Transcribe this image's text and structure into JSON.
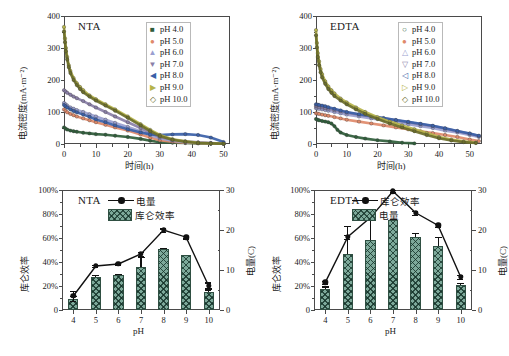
{
  "figure": {
    "panel_count": 4,
    "ph_legend_labels": [
      "pH 4.0",
      "pH 5.0",
      "pH 6.0",
      "pH 7.0",
      "pH 8.0",
      "pH 9.0",
      "pH 10.0"
    ],
    "ph_series_colors": [
      "#2f5d3a",
      "#e08a6a",
      "#9a9fd0",
      "#8a7fa8",
      "#3a5fa8",
      "#b5b34a",
      "#6b6e2a"
    ],
    "marker_glyphs": [
      "■",
      "●",
      "▲",
      "▼",
      "◀",
      "▶",
      "◇"
    ],
    "accent_line_color": "#111111",
    "bar_fill_color": "#7da99a",
    "bar_edge_color": "#2f4f42"
  },
  "chart_data": [
    {
      "id": "panel-a-nta-current-density",
      "type": "line",
      "title": "NTA",
      "xlabel": "时间(h)",
      "ylabel": "电流密度(mA·m⁻²)",
      "xlim": [
        0,
        52
      ],
      "ylim": [
        0,
        400
      ],
      "xticks": [
        0,
        10,
        20,
        30,
        40,
        50
      ],
      "yticks": [
        0,
        100,
        200,
        300,
        400
      ],
      "ytick_labels": [
        "0",
        "100",
        "200",
        "300",
        "400"
      ],
      "grid": false,
      "legend_position": "top-right",
      "legend_entries": [
        "pH 4.0",
        "pH 5.0",
        "pH 6.0",
        "pH 7.0",
        "pH 8.0",
        "pH 9.0",
        "pH 10.0"
      ],
      "series": [
        {
          "name": "pH 4.0",
          "color": "#2f5d3a",
          "marker": "■",
          "x": [
            0,
            0.5,
            1,
            2,
            3,
            4,
            6,
            8,
            10,
            13,
            16,
            20,
            24,
            27,
            30,
            34,
            38,
            42,
            46,
            50
          ],
          "y": [
            52,
            48,
            45,
            42,
            40,
            38,
            35,
            33,
            31,
            29,
            26,
            22,
            16,
            10,
            6,
            4,
            3,
            2,
            1,
            1
          ]
        },
        {
          "name": "pH 5.0",
          "color": "#e08a6a",
          "marker": "●",
          "x": [
            0,
            0.5,
            1,
            2,
            3,
            4,
            6,
            8,
            10,
            13,
            16,
            20,
            24,
            27,
            30,
            34,
            38,
            42,
            46,
            50
          ],
          "y": [
            108,
            103,
            99,
            94,
            90,
            86,
            80,
            74,
            68,
            60,
            52,
            42,
            30,
            20,
            12,
            7,
            4,
            3,
            2,
            1
          ]
        },
        {
          "name": "pH 6.0",
          "color": "#9a9fd0",
          "marker": "▲",
          "x": [
            0,
            0.5,
            1,
            2,
            3,
            4,
            6,
            8,
            10,
            13,
            16,
            20,
            24,
            27,
            30,
            34,
            38,
            42,
            46,
            50
          ],
          "y": [
            128,
            124,
            120,
            114,
            110,
            106,
            100,
            93,
            86,
            76,
            66,
            53,
            40,
            28,
            18,
            10,
            6,
            4,
            2,
            1
          ]
        },
        {
          "name": "pH 7.0",
          "color": "#8a7fa8",
          "marker": "▼",
          "x": [
            0,
            0.5,
            1,
            2,
            3,
            4,
            6,
            8,
            10,
            13,
            16,
            20,
            24,
            27,
            30,
            34,
            38,
            42,
            46,
            50
          ],
          "y": [
            168,
            164,
            160,
            154,
            148,
            143,
            134,
            124,
            114,
            100,
            86,
            68,
            50,
            34,
            22,
            13,
            8,
            5,
            3,
            1
          ]
        },
        {
          "name": "pH 8.0",
          "color": "#3a5fa8",
          "marker": "◀",
          "x": [
            0,
            0.5,
            1,
            2,
            3,
            4,
            6,
            8,
            10,
            13,
            16,
            20,
            24,
            27,
            30,
            34,
            38,
            42,
            46,
            50
          ],
          "y": [
            122,
            118,
            114,
            108,
            103,
            99,
            92,
            85,
            77,
            68,
            58,
            46,
            36,
            30,
            28,
            30,
            31,
            28,
            20,
            6
          ]
        },
        {
          "name": "pH 9.0",
          "color": "#b5b34a",
          "marker": "▶",
          "x": [
            0,
            0.3,
            0.6,
            1,
            1.5,
            2,
            3,
            4,
            5,
            6,
            8,
            10,
            13,
            16,
            20,
            24,
            27,
            30,
            34,
            38,
            42,
            46,
            50
          ],
          "y": [
            366,
            330,
            300,
            272,
            246,
            228,
            206,
            190,
            178,
            168,
            152,
            140,
            124,
            108,
            86,
            62,
            44,
            28,
            15,
            8,
            4,
            2,
            1
          ]
        },
        {
          "name": "pH 10.0",
          "color": "#6b6e2a",
          "marker": "◇",
          "x": [
            0,
            0.3,
            0.6,
            1,
            1.5,
            2,
            3,
            4,
            5,
            6,
            8,
            10,
            13,
            16,
            20,
            24,
            27,
            30,
            34,
            38,
            42,
            46,
            50
          ],
          "y": [
            352,
            318,
            290,
            264,
            240,
            222,
            200,
            184,
            172,
            162,
            148,
            136,
            120,
            104,
            82,
            58,
            40,
            25,
            13,
            7,
            3,
            2,
            1
          ]
        }
      ]
    },
    {
      "id": "panel-b-edta-current-density",
      "type": "line",
      "title": "EDTA",
      "xlabel": "时间(h)",
      "ylabel": "电流密度(mA·m⁻²)",
      "xlim": [
        0,
        54
      ],
      "ylim": [
        0,
        400
      ],
      "xticks": [
        0,
        10,
        20,
        30,
        40,
        50
      ],
      "yticks": [
        0,
        100,
        200,
        300,
        400
      ],
      "ytick_labels": [
        "0",
        "100",
        "200",
        "300",
        "400"
      ],
      "grid": false,
      "legend_position": "top-right",
      "legend_entries": [
        "pH 4.0",
        "pH 5.0",
        "pH 6.0",
        "pH 7.0",
        "pH 8.0",
        "pH 9.0",
        "pH 10.0"
      ],
      "series": [
        {
          "name": "pH 4.0",
          "color": "#2f5d3a",
          "marker": "○",
          "x": [
            0,
            0.5,
            1,
            2,
            3,
            4,
            5,
            6,
            7,
            8,
            10,
            13,
            16,
            20,
            24,
            28,
            32
          ],
          "y": [
            78,
            76,
            74,
            72,
            70,
            68,
            64,
            56,
            44,
            36,
            28,
            22,
            17,
            12,
            8,
            4,
            2
          ]
        },
        {
          "name": "pH 5.0",
          "color": "#e08a6a",
          "marker": "●",
          "x": [
            0,
            0.5,
            1,
            2,
            3,
            4,
            6,
            8,
            10,
            14,
            18,
            22,
            26,
            30,
            34,
            38,
            42,
            46,
            50,
            53
          ],
          "y": [
            96,
            95,
            94,
            92,
            90,
            88,
            84,
            80,
            76,
            70,
            64,
            58,
            52,
            46,
            40,
            34,
            28,
            22,
            14,
            9
          ]
        },
        {
          "name": "pH 6.0",
          "color": "#9a9fd0",
          "marker": "△",
          "x": [
            0,
            0.5,
            1,
            2,
            3,
            4,
            6,
            8,
            10,
            14,
            18,
            22,
            26,
            30,
            34,
            38,
            42,
            46,
            50,
            53
          ],
          "y": [
            112,
            111,
            110,
            108,
            106,
            104,
            100,
            96,
            92,
            86,
            80,
            74,
            68,
            62,
            56,
            50,
            42,
            36,
            28,
            22
          ]
        },
        {
          "name": "pH 7.0",
          "color": "#8a7fa8",
          "marker": "▽",
          "x": [
            0,
            0.5,
            1,
            2,
            3,
            4,
            6,
            8,
            10,
            14,
            18,
            22,
            26,
            30,
            34,
            38,
            42,
            46,
            50,
            53
          ],
          "y": [
            118,
            117,
            116,
            114,
            112,
            110,
            106,
            102,
            98,
            92,
            86,
            80,
            74,
            68,
            62,
            56,
            48,
            40,
            32,
            25
          ]
        },
        {
          "name": "pH 8.0",
          "color": "#3a5fa8",
          "marker": "◁",
          "x": [
            0,
            0.5,
            1,
            2,
            3,
            4,
            6,
            8,
            10,
            14,
            18,
            22,
            26,
            30,
            34,
            38,
            42,
            46,
            50,
            53
          ],
          "y": [
            124,
            123,
            122,
            120,
            118,
            115,
            110,
            105,
            100,
            93,
            87,
            81,
            75,
            69,
            63,
            57,
            49,
            41,
            33,
            26
          ]
        },
        {
          "name": "pH 9.0",
          "color": "#b5b34a",
          "marker": "▷",
          "x": [
            0,
            0.3,
            0.6,
            1,
            1.5,
            2,
            3,
            4,
            5,
            6,
            8,
            10,
            13,
            16,
            20,
            24,
            28,
            32,
            36,
            40,
            44,
            48,
            52
          ],
          "y": [
            356,
            316,
            284,
            258,
            234,
            218,
            196,
            180,
            168,
            158,
            142,
            130,
            114,
            100,
            84,
            70,
            58,
            46,
            34,
            22,
            14,
            8,
            4
          ]
        },
        {
          "name": "pH 10.0",
          "color": "#6b6e2a",
          "marker": "◇",
          "x": [
            0,
            0.3,
            0.6,
            1,
            1.5,
            2,
            3,
            4,
            5,
            6,
            8,
            10,
            13,
            16,
            20,
            24,
            28,
            32,
            36,
            40,
            44,
            48,
            52
          ],
          "y": [
            340,
            302,
            272,
            246,
            224,
            208,
            188,
            172,
            160,
            150,
            136,
            124,
            108,
            94,
            78,
            64,
            52,
            40,
            28,
            18,
            11,
            6,
            3
          ]
        }
      ]
    },
    {
      "id": "panel-c-nta-coulombic-charge",
      "type": "bar",
      "title": "NTA",
      "xlabel": "pH",
      "ylabel": "库仑效率",
      "y2label": "电量(C)",
      "categories": [
        "4",
        "5",
        "6",
        "7",
        "8",
        "9",
        "10"
      ],
      "ylim": [
        0,
        100
      ],
      "yticks": [
        0,
        20,
        40,
        60,
        80,
        100
      ],
      "ytick_labels": [
        "0",
        "20%",
        "40%",
        "60%",
        "80%",
        "100%"
      ],
      "y2lim": [
        0,
        30
      ],
      "y2ticks": [
        0,
        10,
        20,
        30
      ],
      "y2tick_labels": [
        "0",
        "10",
        "20",
        "30"
      ],
      "grid": false,
      "legend_position": "top-center",
      "bar_series": {
        "name": "库仑效率",
        "axis": "left",
        "unit": "%",
        "values": [
          9,
          27.5,
          29,
          36,
          50.5,
          46,
          15
        ],
        "errors": [
          3,
          1.5,
          0.8,
          8,
          1.5,
          0,
          3
        ]
      },
      "line_series": {
        "name": "电量",
        "axis": "right",
        "unit": "C",
        "values": [
          3.5,
          11,
          11.5,
          14,
          20,
          18.2,
          6
        ],
        "errors": [
          1.2,
          0.3,
          0.2,
          0.5,
          0.4,
          0.3,
          0.9
        ]
      }
    },
    {
      "id": "panel-d-edta-coulombic-charge",
      "type": "bar",
      "title": "EDTA",
      "xlabel": "pH",
      "ylabel": "库仑效率",
      "y2label": "电量(C)",
      "categories": [
        "4",
        "5",
        "6",
        "7",
        "8",
        "9",
        "10"
      ],
      "ylim": [
        0,
        100
      ],
      "yticks": [
        0,
        20,
        40,
        60,
        80,
        100
      ],
      "ytick_labels": [
        "0",
        "20%",
        "40%",
        "60%",
        "80%",
        "100%"
      ],
      "y2lim": [
        0,
        30
      ],
      "y2ticks": [
        0,
        10,
        20,
        30
      ],
      "y2tick_labels": [
        "0",
        "10",
        "20",
        "30"
      ],
      "grid": false,
      "legend_position": "top-right",
      "bar_series": {
        "name": "电量",
        "axis": "right",
        "unit": "C",
        "values": [
          5.3,
          14,
          17.5,
          22.5,
          18.3,
          16,
          6.2
        ],
        "errors": [
          0.6,
          7,
          5.5,
          0.3,
          1,
          2.2,
          0.6
        ]
      },
      "line_series": {
        "name": "库仑效率",
        "axis": "left",
        "unit": "%",
        "values": [
          23,
          61,
          77,
          99,
          81,
          70.5,
          27.5
        ],
        "errors": [
          1.5,
          1.5,
          1.5,
          1,
          1.5,
          1.5,
          1.5
        ]
      }
    }
  ]
}
